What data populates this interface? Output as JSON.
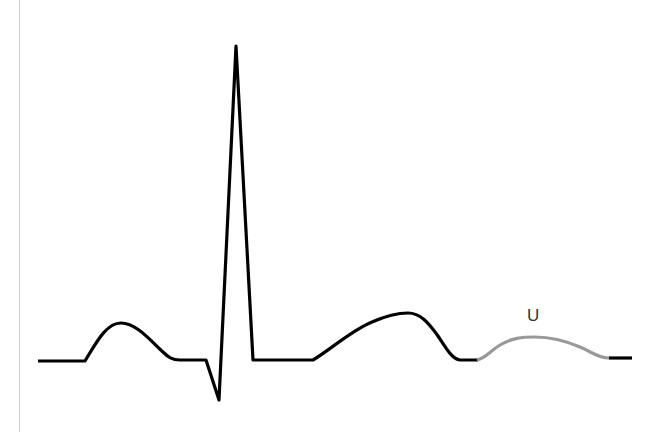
{
  "diagram": {
    "type": "ecg-waveform",
    "colors": {
      "trace": "#000000",
      "highlight": "#999999",
      "label": "#333333",
      "axis_line": "#cfcfcf"
    },
    "labels": {
      "u_wave": "U"
    },
    "segments": [
      {
        "name": "baseline-start",
        "highlighted": false
      },
      {
        "name": "p-wave",
        "highlighted": false
      },
      {
        "name": "pr-segment",
        "highlighted": false
      },
      {
        "name": "qrs-complex",
        "highlighted": false
      },
      {
        "name": "st-segment",
        "highlighted": false
      },
      {
        "name": "t-wave",
        "highlighted": false
      },
      {
        "name": "u-wave",
        "highlighted": true
      },
      {
        "name": "baseline-end",
        "highlighted": false
      }
    ]
  }
}
